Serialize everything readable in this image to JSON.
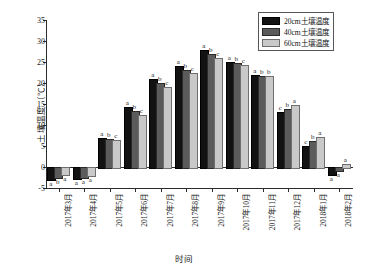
{
  "chart_data": {
    "type": "bar",
    "title": "",
    "xlabel": "时间",
    "ylabel": "土壤温度（℃）",
    "ylim": [
      -5,
      35
    ],
    "yticks": [
      -5,
      0,
      5,
      10,
      15,
      20,
      25,
      30,
      35
    ],
    "grid": false,
    "legend_position": "top-right",
    "categories": [
      "2017年3月",
      "2017年4月",
      "2017年5月",
      "2017年6月",
      "2017年7月",
      "2017年8月",
      "2017年9月",
      "2017年10月",
      "2017年11月",
      "2017年12月",
      "2018年1月",
      "2018年2月"
    ],
    "series": [
      {
        "name": "20cm土壤温度",
        "color": "#121212",
        "values": [
          -2.9,
          -2.5,
          6.9,
          14.3,
          21.0,
          24.0,
          27.9,
          25.1,
          21.8,
          13.2,
          5.1,
          -1.6
        ],
        "sig_letters": [
          "a",
          "a",
          "a",
          "a",
          "a",
          "a",
          "a",
          "a",
          "a",
          "c",
          "c",
          "a"
        ]
      },
      {
        "name": "40cm土壤温度",
        "color": "#5b5b5b",
        "values": [
          -2.3,
          -2.3,
          6.6,
          13.4,
          20.0,
          23.1,
          27.0,
          24.8,
          21.6,
          13.9,
          6.1,
          -0.8
        ],
        "sig_letters": [
          "b",
          "a",
          "b",
          "b",
          "b",
          "b",
          "b",
          "b",
          "b",
          "b",
          "b",
          "a"
        ]
      },
      {
        "name": "60cm土壤温度",
        "color": "#c9c9c9",
        "values": [
          -1.6,
          -1.9,
          6.4,
          12.5,
          19.0,
          22.5,
          26.0,
          24.4,
          21.6,
          14.8,
          7.2,
          0.8
        ],
        "sig_letters": [
          "a",
          "a",
          "c",
          "c",
          "c",
          "c",
          "c",
          "c",
          "b",
          "a",
          "a",
          "a"
        ]
      }
    ]
  },
  "legend": {
    "items": [
      {
        "label": "20cm土壤温度",
        "color": "#121212"
      },
      {
        "label": "40cm土壤温度",
        "color": "#5b5b5b"
      },
      {
        "label": "60cm土壤温度",
        "color": "#c9c9c9"
      }
    ]
  }
}
